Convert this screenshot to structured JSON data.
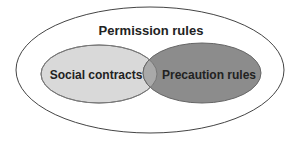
{
  "diagram": {
    "type": "venn",
    "outer": {
      "label": "Permission rules",
      "fill": "#ffffff",
      "stroke": "#444444"
    },
    "sets": [
      {
        "label": "Social contracts",
        "fill": "#d9d9d9",
        "stroke": "#777777"
      },
      {
        "label": "Precaution rules",
        "fill": "#8c8c8c",
        "stroke": "#666666"
      }
    ],
    "overlap": {
      "fill": "#a9a9a9"
    }
  }
}
